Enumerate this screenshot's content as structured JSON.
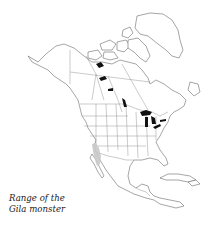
{
  "map": {
    "subject": "North America",
    "style": "outline map with political boundaries",
    "highlighted_region": {
      "label": "Gila monster range",
      "location": "southwestern United States and northwestern Mexico",
      "color": "#c9c9c9"
    },
    "lake_color": "#111111",
    "line_color": "#6a6a6a",
    "background_color": "#ffffff"
  },
  "caption": {
    "line1": "Range of the",
    "line2": "Gila monster"
  }
}
